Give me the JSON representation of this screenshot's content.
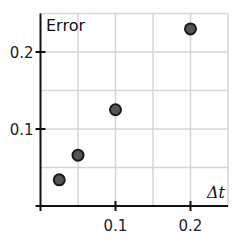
{
  "chart_data": {
    "type": "scatter",
    "title": "",
    "xlabel": "Δt",
    "ylabel": "Error",
    "xlim": [
      0,
      0.25
    ],
    "ylim": [
      0,
      0.25
    ],
    "grid": true,
    "grid_step": 0.05,
    "x_ticks": [
      0.1,
      0.2
    ],
    "x_tick_labels": [
      "0.1",
      "0.2"
    ],
    "y_ticks": [
      0.1,
      0.2
    ],
    "y_tick_labels": [
      "0.1",
      "0.2"
    ],
    "legend": null,
    "series": [
      {
        "name": "Error vs Δt",
        "x": [
          0.025,
          0.05,
          0.1,
          0.2
        ],
        "y": [
          0.034,
          0.066,
          0.125,
          0.23
        ]
      }
    ],
    "colors": {
      "marker_fill": "#555555",
      "marker_stroke": "#1a1a1a",
      "grid": "#d6d6d6",
      "axis": "#111111"
    }
  }
}
